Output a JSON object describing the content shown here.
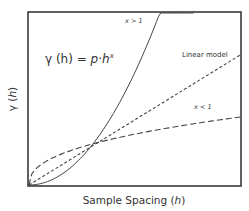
{
  "chart_data": {
    "type": "line",
    "title": "",
    "xlabel": "Sample Spacing (h)",
    "xlabel_parts": {
      "text": "Sample Spacing (",
      "var": "h",
      "close": ")"
    },
    "ylabel": "γ (h)",
    "ylabel_parts": {
      "sym": "γ (",
      "var": "h",
      "close": ")"
    },
    "formula": {
      "lhs": "γ (h) = ",
      "p": "p",
      "dot": "·",
      "h": "h",
      "exp": "x",
      "text": "γ(h) = p·h^x"
    },
    "xlim": [
      0,
      1
    ],
    "ylim": [
      0,
      1
    ],
    "ticks": false,
    "grid": false,
    "intersection": [
      0.29,
      0.22
    ],
    "series": [
      {
        "name": "x > 1",
        "style": "solid",
        "exponent": 2.0,
        "scale": 2.6,
        "x_end": 0.78
      },
      {
        "name": "Linear model",
        "style": "short-dash",
        "exponent": 1.0,
        "scale": 0.755,
        "x_end": 1.0
      },
      {
        "name": "x < 1",
        "style": "long-dash",
        "exponent": 0.42,
        "scale": 0.395,
        "x_end": 1.0
      }
    ],
    "annotations": [
      {
        "text": "x > 1",
        "series": "x > 1"
      },
      {
        "text": "Linear model",
        "series": "Linear model"
      },
      {
        "text": "x < 1",
        "series": "x < 1"
      }
    ]
  }
}
